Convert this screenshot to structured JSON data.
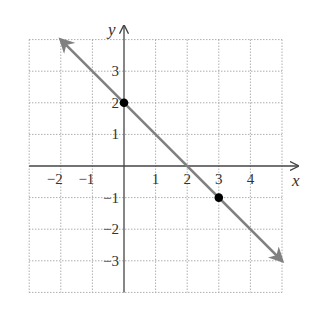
{
  "chart_data": {
    "type": "line",
    "title": "",
    "xlabel": "x",
    "ylabel": "y",
    "xlim": [
      -3,
      5
    ],
    "ylim": [
      -4,
      4
    ],
    "grid": true,
    "x_ticks": [
      -2,
      -1,
      1,
      2,
      3,
      4
    ],
    "y_ticks": [
      3,
      2,
      1,
      -1,
      -2,
      -3
    ],
    "x_tick_labels": [
      "−2",
      "−1",
      "1",
      "2",
      "3",
      "4"
    ],
    "y_tick_labels": [
      "3",
      "2",
      "1",
      "−1",
      "−2",
      "−3"
    ],
    "series": [
      {
        "name": "y = -x + 2",
        "kind": "line-with-arrows",
        "from": [
          -2,
          4
        ],
        "to": [
          5,
          -3
        ],
        "color": "#808080"
      }
    ],
    "points": [
      {
        "x": 0,
        "y": 2,
        "color": "#000000"
      },
      {
        "x": 3,
        "y": -1,
        "color": "#000000"
      }
    ]
  },
  "colors": {
    "grid": "#9a9a9a",
    "axis": "#444444",
    "line": "#808080",
    "point": "#000000"
  }
}
